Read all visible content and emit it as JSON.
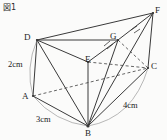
{
  "figure": {
    "caption": "図1",
    "title_text": "図1",
    "stroke_color": "#3a3a3a",
    "dashed_color": "#555555",
    "arc_color": "#9a9a9a",
    "background_color": "#fbfbfa"
  },
  "vertices": [
    {
      "id": "D",
      "label": "D",
      "x": 37,
      "y": 40,
      "label_x": 24,
      "label_y": 33
    },
    {
      "id": "F",
      "label": "F",
      "x": 153,
      "y": 13,
      "label_x": 155,
      "label_y": 6
    },
    {
      "id": "G",
      "label": "G",
      "x": 118,
      "y": 40,
      "label_x": 110,
      "label_y": 32
    },
    {
      "id": "E",
      "label": "E",
      "x": 88,
      "y": 62,
      "label_x": 85,
      "label_y": 55
    },
    {
      "id": "C",
      "label": "C",
      "x": 148,
      "y": 68,
      "label_x": 151,
      "label_y": 62
    },
    {
      "id": "A",
      "label": "A",
      "x": 33,
      "y": 96,
      "label_x": 22,
      "label_y": 92
    },
    {
      "id": "B",
      "label": "B",
      "x": 88,
      "y": 126,
      "label_x": 85,
      "label_y": 129
    }
  ],
  "dimensions": [
    {
      "id": "edge-AD",
      "label": "2cm",
      "label_x": 8,
      "label_y": 60
    },
    {
      "id": "edge-AB",
      "label": "3cm",
      "label_x": 36,
      "label_y": 115
    },
    {
      "id": "edge-BC",
      "label": "4cm",
      "label_x": 123,
      "label_y": 101
    }
  ],
  "solid_edges": [
    {
      "name": "edge-D-F",
      "from": "D",
      "to": "F"
    },
    {
      "name": "edge-D-G",
      "from": "D",
      "to": "G"
    },
    {
      "name": "edge-G-F",
      "from": "G",
      "to": "F"
    },
    {
      "name": "edge-D-E",
      "from": "D",
      "to": "E"
    },
    {
      "name": "edge-E-G",
      "from": "E",
      "to": "G"
    },
    {
      "name": "edge-D-A",
      "from": "D",
      "to": "A"
    },
    {
      "name": "edge-D-B",
      "from": "D",
      "to": "B"
    },
    {
      "name": "edge-A-B",
      "from": "A",
      "to": "B"
    },
    {
      "name": "edge-E-B",
      "from": "E",
      "to": "B"
    },
    {
      "name": "edge-G-B",
      "from": "G",
      "to": "B"
    },
    {
      "name": "edge-F-B",
      "from": "F",
      "to": "B"
    },
    {
      "name": "edge-F-C",
      "from": "F",
      "to": "C"
    },
    {
      "name": "edge-C-B",
      "from": "C",
      "to": "B"
    }
  ],
  "dashed_edges": [
    {
      "name": "edge-A-C-hidden",
      "from": "A",
      "to": "C"
    },
    {
      "name": "edge-E-C-hidden",
      "from": "E",
      "to": "C"
    },
    {
      "name": "edge-G-C-hidden",
      "from": "G",
      "to": "C"
    }
  ],
  "tick_marks": [
    {
      "name": "tick-eg-1",
      "x1": 104,
      "y1": 46,
      "x2": 110,
      "y2": 41
    },
    {
      "name": "tick-eg-2",
      "x1": 107,
      "y1": 49,
      "x2": 113,
      "y2": 44
    },
    {
      "name": "tick-gf-1",
      "x1": 131,
      "y1": 30,
      "x2": 137,
      "y2": 26
    },
    {
      "name": "tick-gf-2",
      "x1": 134,
      "y1": 33,
      "x2": 140,
      "y2": 29
    }
  ],
  "arcs": [
    {
      "name": "arc-2cm",
      "d": "M 37 40 Q 25 68 33 96"
    },
    {
      "name": "arc-3cm",
      "d": "M 33 96 Q 55 122 88 126"
    },
    {
      "name": "arc-4cm",
      "d": "M 88 126 Q 133 118 148 68"
    }
  ]
}
